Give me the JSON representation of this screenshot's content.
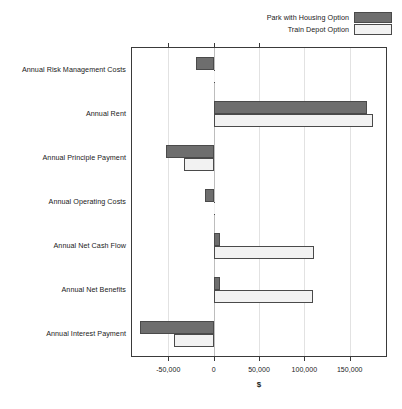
{
  "chart_data": {
    "type": "bar",
    "orientation": "horizontal",
    "title": "",
    "xlabel": "$",
    "ylabel": "",
    "xlim": [
      -90000,
      190000
    ],
    "xticks": [
      -50000,
      0,
      50000,
      100000,
      150000
    ],
    "xtick_labels": [
      "-50,000",
      "0",
      "50,000",
      "100,000",
      "150,000"
    ],
    "grid": true,
    "legend_position": "top-right",
    "categories": [
      "Annual Risk Management Costs",
      "Annual Rent",
      "Annual Principle Payment",
      "Annual Operating Costs",
      "Annual Net Cash Flow",
      "Annual Net Benefits",
      "Annual Interest Payment"
    ],
    "series": [
      {
        "name": "Park with Housing Option",
        "color": "#6e6e6e",
        "values": [
          -19000,
          169000,
          -53000,
          -10000,
          7000,
          7000,
          -81000
        ]
      },
      {
        "name": "Train Depot Option",
        "color": "#f2f2f2",
        "values": [
          0,
          176000,
          -33000,
          0,
          111000,
          110000,
          -44000
        ]
      }
    ]
  },
  "legend": {
    "items": [
      {
        "label": "Park with Housing Option",
        "swatch": "dark"
      },
      {
        "label": "Train Depot Option",
        "swatch": "light"
      }
    ]
  },
  "axis": {
    "x_title": "$"
  },
  "colors": {
    "series_dark": "#6e6e6e",
    "series_light": "#f2f2f2",
    "outline": "#4a4a4a",
    "frame": "#3a3a3a",
    "grid": "#e2e2e2"
  }
}
